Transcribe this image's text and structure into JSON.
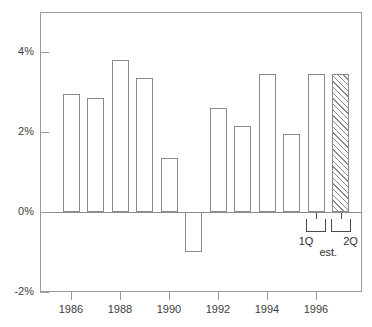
{
  "chart_data": {
    "type": "bar",
    "title": "",
    "subtitle": "",
    "xlabel": "",
    "ylabel": "",
    "categories": [
      "1986",
      "1987",
      "1988",
      "1989",
      "1990",
      "1991",
      "1992",
      "1993",
      "1994",
      "1995",
      "1996 1Q",
      "1996 2Q"
    ],
    "values": [
      2.95,
      2.85,
      3.8,
      3.35,
      1.35,
      -1.0,
      2.6,
      2.15,
      3.45,
      1.95,
      3.45,
      3.45
    ],
    "series": [
      {
        "name": "",
        "values": [
          2.95,
          2.85,
          3.8,
          3.35,
          1.35,
          -1.0,
          2.6,
          2.15,
          3.45,
          1.95,
          3.45,
          3.45
        ]
      }
    ],
    "ylim": [
      -2,
      5
    ],
    "ytick_values": [
      4,
      2,
      0,
      -2
    ],
    "ytick_labels": [
      "4%",
      "2%",
      "0%",
      "-2%"
    ],
    "xtick_values": [
      1986,
      1988,
      1990,
      1992,
      1994,
      1996
    ],
    "xtick_labels": [
      "1986",
      "1988",
      "1990",
      "1992",
      "1994",
      "1996"
    ],
    "grid": false,
    "legend": "none",
    "bar_style": {
      "fill": "#ffffff",
      "edge": "#8a8a8a",
      "hatched_fill": "hatched-diagonal"
    },
    "hatched_categories": [
      "1996 2Q"
    ],
    "annotations": [
      {
        "name": "quarter-1-label",
        "text": "1Q",
        "target": "1996 1Q"
      },
      {
        "name": "quarter-2-label",
        "text": "2Q",
        "target": "1996 2Q"
      },
      {
        "name": "estimate-label",
        "text": "est.",
        "target": "1996 1Q and 1996 2Q"
      }
    ]
  },
  "axes": {
    "y": {
      "ticks": [
        {
          "label": "4%",
          "value": 4
        },
        {
          "label": "2%",
          "value": 2
        },
        {
          "label": "0%",
          "value": 0
        },
        {
          "label": "-2%",
          "value": -2
        }
      ]
    },
    "x": {
      "ticks": [
        {
          "label": "1986",
          "value": 1986
        },
        {
          "label": "1988",
          "value": 1988
        },
        {
          "label": "1990",
          "value": 1990
        },
        {
          "label": "1992",
          "value": 1992
        },
        {
          "label": "1994",
          "value": 1994
        },
        {
          "label": "1996",
          "value": 1996
        }
      ]
    }
  },
  "annotations": {
    "q1": "1Q",
    "q2": "2Q",
    "est": "est."
  },
  "colors": {
    "frame": "#9a9a9a",
    "bar_edge": "#8a8a8a",
    "bar_fill": "#ffffff",
    "text": "#3c3c3c",
    "annotation": "#2f2f2f",
    "background": "#ffffff"
  }
}
